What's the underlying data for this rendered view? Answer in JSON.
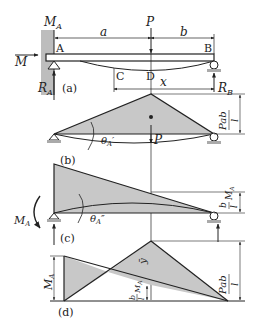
{
  "figure": {
    "panels": [
      {
        "id": "a",
        "caption": "(a)",
        "labels": {
          "moment_at_A": "M",
          "moment_at_A_sub": "A",
          "applied_moment": "M",
          "load": "P",
          "span_a": "a",
          "span_b": "b",
          "point_A": "A",
          "point_B": "B",
          "point_C": "C",
          "point_D": "D",
          "distance_x": "x",
          "reaction_A": "R",
          "reaction_A_sub": "A",
          "reaction_B": "R",
          "reaction_B_sub": "B"
        }
      },
      {
        "id": "b",
        "caption": "(b)",
        "labels": {
          "angle": "θ",
          "angle_sub": "A",
          "angle_prime": "′",
          "load": "P",
          "peak_num": "Pab",
          "peak_den": "l"
        }
      },
      {
        "id": "c",
        "caption": "(c)",
        "labels": {
          "angle": "θ",
          "angle_sub": "A",
          "angle_prime": "″",
          "moment": "M",
          "moment_sub": "A",
          "height_num": "b",
          "height_den": "l",
          "height_suffix": "M",
          "height_suffix_sub": "A"
        }
      },
      {
        "id": "d",
        "caption": "(d)",
        "labels": {
          "left_height": "M",
          "left_height_sub": "A",
          "ybar": "ȳ",
          "mid_num": "b",
          "mid_den": "l",
          "mid_suffix": "M",
          "mid_suffix_sub": "A",
          "peak_num": "Pab",
          "peak_den": "l"
        }
      }
    ],
    "colors": {
      "line": "#222222",
      "fill": "#c8c8c8",
      "wall": "#bdbdbd"
    }
  }
}
